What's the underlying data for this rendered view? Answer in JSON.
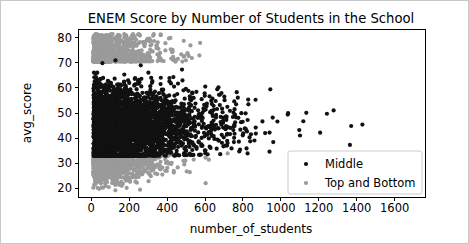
{
  "figure": {
    "width": 469,
    "height": 244,
    "background": "#ffffff",
    "border_color": "#c8c8c8"
  },
  "chart_data": {
    "type": "scatter",
    "title": "ENEM Score by Number of Students in the School",
    "xlabel": "number_of_students",
    "ylabel": "avg_score",
    "xlim": [
      -70,
      1760
    ],
    "ylim": [
      16.5,
      83.5
    ],
    "xticks": [
      0,
      200,
      400,
      600,
      800,
      1000,
      1200,
      1400,
      1600
    ],
    "xticklabels": [
      "0",
      "200",
      "400",
      "600",
      "800",
      "1000",
      "1200",
      "1400",
      "1600"
    ],
    "yticks": [
      20,
      30,
      40,
      50,
      60,
      70,
      80
    ],
    "yticklabels": [
      "20",
      "30",
      "40",
      "50",
      "60",
      "70",
      "80"
    ],
    "grid": false,
    "legend_position": "lower right",
    "series": [
      {
        "name": "Middle",
        "color": "#111111",
        "marker": "o",
        "marker_size": 2.1,
        "point_count": 4200,
        "density": {
          "model": "dense-left-wedge",
          "x_mode": 150,
          "x_decay": 210,
          "x_min": 12,
          "x_max": 1650,
          "y_center": 45.0,
          "y_spread": 7.4,
          "y_min": 33.0,
          "y_max": 71.0,
          "taper_start": 420,
          "taper_power": 1.45
        }
      },
      {
        "name": "Top and Bottom",
        "color": "#9a9a9a",
        "marker": "o",
        "marker_size": 2.1,
        "point_count": 2300,
        "density": {
          "model": "halo-bands",
          "x_mode": 120,
          "x_decay": 150,
          "x_min": 10,
          "x_max": 800,
          "upper_band": [
            70.5,
            81.5
          ],
          "lower_band": [
            18.0,
            34.5
          ],
          "upper_fraction": 0.42,
          "taper_start": 230,
          "taper_power": 1.7
        }
      }
    ],
    "annotations": []
  },
  "legend": {
    "entries": [
      {
        "label": "Middle",
        "color": "#111111"
      },
      {
        "label": "Top and Bottom",
        "color": "#9a9a9a"
      }
    ]
  },
  "axes_geometry": {
    "left": 77,
    "right": 424,
    "top": 28,
    "bottom": 196
  }
}
